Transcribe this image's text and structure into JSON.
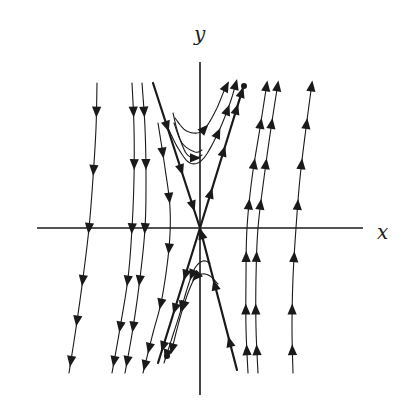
{
  "diagram": {
    "type": "phase-portrait",
    "axes": {
      "x_label": "x",
      "y_label": "y",
      "x_range": [
        -1.63,
        1.63
      ],
      "y_range": [
        -1.67,
        1.66
      ]
    },
    "colors": {
      "ink": "#1a1a1a",
      "background": "#ffffff"
    },
    "equilibrium": {
      "x": 0,
      "y": 0,
      "kind": "saddle"
    },
    "separatrices": [
      {
        "name": "stable-left-upper",
        "points": [
          [
            -0.47,
            1.45
          ],
          [
            0,
            0
          ]
        ],
        "direction": "forward",
        "arrows_at": [
          0.3,
          0.6,
          0.85
        ]
      },
      {
        "name": "unstable-right-upper",
        "points": [
          [
            0,
            0
          ],
          [
            0.43,
            1.4
          ]
        ],
        "direction": "forward",
        "arrows_at": [
          0.25,
          0.55,
          0.85,
          0.97
        ]
      },
      {
        "name": "unstable-left-lower",
        "points": [
          [
            0,
            0
          ],
          [
            -0.42,
            -1.35
          ]
        ],
        "direction": "forward",
        "arrows_at": [
          0.35,
          0.6,
          0.88
        ]
      },
      {
        "name": "stable-right-lower",
        "points": [
          [
            0.37,
            -1.42
          ],
          [
            0,
            0
          ]
        ],
        "direction": "forward",
        "arrows_at": [
          0.2,
          0.6,
          0.96
        ]
      }
    ],
    "trajectories": [
      {
        "points": [
          [
            -1.03,
            1.45
          ],
          [
            -1.04,
            1.0
          ],
          [
            -1.07,
            0.5
          ],
          [
            -1.11,
            0.0
          ],
          [
            -1.17,
            -0.5
          ],
          [
            -1.24,
            -1.0
          ],
          [
            -1.31,
            -1.45
          ]
        ],
        "arrows_at": [
          0.1,
          0.3,
          0.5,
          0.68,
          0.82,
          0.96
        ]
      },
      {
        "points": [
          [
            -0.68,
            1.45
          ],
          [
            -0.66,
            1.0
          ],
          [
            -0.66,
            0.5
          ],
          [
            -0.68,
            0.0
          ],
          [
            -0.72,
            -0.5
          ],
          [
            -0.8,
            -1.0
          ],
          [
            -0.88,
            -1.45
          ]
        ],
        "arrows_at": [
          0.1,
          0.28,
          0.5,
          0.68,
          0.84,
          0.96
        ]
      },
      {
        "points": [
          [
            -0.58,
            1.45
          ],
          [
            -0.55,
            1.0
          ],
          [
            -0.54,
            0.5
          ],
          [
            -0.55,
            0.0
          ],
          [
            -0.6,
            -0.5
          ],
          [
            -0.67,
            -1.0
          ],
          [
            -0.75,
            -1.45
          ]
        ],
        "arrows_at": [
          0.1,
          0.28,
          0.5,
          0.68,
          0.84,
          0.96
        ]
      },
      {
        "points": [
          [
            -0.42,
            1.05
          ],
          [
            -0.35,
            0.6
          ],
          [
            -0.3,
            0.2
          ],
          [
            -0.31,
            -0.2
          ],
          [
            -0.38,
            -0.7
          ],
          [
            -0.47,
            -1.05
          ],
          [
            -0.57,
            -1.45
          ]
        ],
        "arrows_at": [
          0.12,
          0.3,
          0.5,
          0.72,
          0.9,
          0.97
        ]
      },
      {
        "points": [
          [
            -0.27,
            1.15
          ],
          [
            -0.22,
            0.95
          ],
          [
            -0.14,
            0.75
          ],
          [
            -0.05,
            0.7
          ],
          [
            0.02,
            0.73
          ]
        ],
        "arrows_at": [
          0.88
        ]
      },
      {
        "points": [
          [
            -0.32,
            1.0
          ],
          [
            -0.22,
            0.8
          ],
          [
            -0.1,
            0.65
          ],
          [
            0.03,
            0.69
          ],
          [
            0.18,
            0.95
          ],
          [
            0.3,
            1.25
          ],
          [
            0.36,
            1.45
          ]
        ],
        "arrows_at": [
          0.62,
          0.8,
          0.99
        ]
      },
      {
        "points": [
          [
            -0.26,
            1.05
          ],
          [
            -0.18,
            0.85
          ],
          [
            -0.05,
            0.76
          ],
          [
            0.02,
            0.78
          ]
        ],
        "arrows_at": []
      },
      {
        "points": [
          [
            -0.25,
            1.1
          ],
          [
            -0.15,
            0.98
          ],
          [
            -0.03,
            0.95
          ],
          [
            0.06,
            1.01
          ],
          [
            0.16,
            1.18
          ],
          [
            0.24,
            1.37
          ],
          [
            0.28,
            1.45
          ]
        ],
        "arrows_at": [
          0.42,
          0.96
        ]
      },
      {
        "points": [
          [
            0.48,
            -1.45
          ],
          [
            0.46,
            -1.0
          ],
          [
            0.46,
            -0.5
          ],
          [
            0.47,
            0.0
          ],
          [
            0.52,
            0.5
          ],
          [
            0.6,
            1.0
          ],
          [
            0.67,
            1.45
          ]
        ],
        "arrows_at": [
          0.08,
          0.22,
          0.4,
          0.58,
          0.72,
          0.86,
          0.99
        ]
      },
      {
        "points": [
          [
            0.58,
            -1.45
          ],
          [
            0.56,
            -1.0
          ],
          [
            0.56,
            -0.5
          ],
          [
            0.58,
            0.0
          ],
          [
            0.64,
            0.5
          ],
          [
            0.71,
            1.0
          ],
          [
            0.78,
            1.45
          ]
        ],
        "arrows_at": [
          0.08,
          0.22,
          0.4,
          0.58,
          0.72,
          0.86,
          0.99
        ]
      },
      {
        "points": [
          [
            0.93,
            -1.45
          ],
          [
            0.92,
            -1.0
          ],
          [
            0.93,
            -0.5
          ],
          [
            0.96,
            0.0
          ],
          [
            1.0,
            0.5
          ],
          [
            1.06,
            1.0
          ],
          [
            1.12,
            1.45
          ]
        ],
        "arrows_at": [
          0.08,
          0.22,
          0.4,
          0.58,
          0.72,
          0.86,
          0.99
        ]
      },
      {
        "points": [
          [
            0.1,
            -0.35
          ],
          [
            0.03,
            -0.33
          ],
          [
            -0.05,
            -0.4
          ],
          [
            -0.12,
            -0.58
          ],
          [
            -0.2,
            -0.85
          ],
          [
            -0.28,
            -1.1
          ],
          [
            -0.36,
            -1.35
          ]
        ],
        "arrows_at": [
          0.22,
          0.5,
          0.93
        ]
      },
      {
        "points": [
          [
            0.18,
            -0.56
          ],
          [
            0.1,
            -0.48
          ],
          [
            0.02,
            -0.46
          ],
          [
            -0.05,
            -0.5
          ],
          [
            -0.12,
            -0.65
          ],
          [
            -0.2,
            -0.9
          ],
          [
            -0.29,
            -1.25
          ]
        ],
        "arrows_at": [
          0.25,
          0.55,
          0.96
        ]
      }
    ],
    "markers": [
      {
        "x": 0.44,
        "y": 1.42
      },
      {
        "x": -0.33,
        "y": -1.28
      }
    ]
  }
}
